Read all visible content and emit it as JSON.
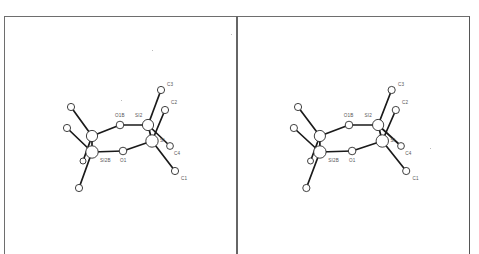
{
  "figure": {
    "type": "stereo ORTEP-style ball-and-stick view",
    "panels": [
      "left-eye",
      "right-eye"
    ]
  },
  "atoms": [
    {
      "id": "si_a",
      "label": "",
      "x": 92,
      "y": 136,
      "r": 5.6
    },
    {
      "id": "si1b",
      "label": "SI2B",
      "x": 92,
      "y": 152,
      "r": 6.2
    },
    {
      "id": "o1b",
      "label": "O1B",
      "x": 120,
      "y": 125,
      "r": 3.8
    },
    {
      "id": "si2",
      "label": "SI2",
      "x": 148,
      "y": 125,
      "r": 5.6
    },
    {
      "id": "si1",
      "label": "SI",
      "x": 152,
      "y": 141,
      "r": 6.2
    },
    {
      "id": "o1",
      "label": "O1",
      "x": 123,
      "y": 151,
      "r": 3.8
    },
    {
      "id": "c3",
      "label": "C3",
      "x": 161,
      "y": 90,
      "r": 3.6
    },
    {
      "id": "c2",
      "label": "C2",
      "x": 165,
      "y": 110,
      "r": 3.6
    },
    {
      "id": "c4",
      "label": "C4",
      "x": 170,
      "y": 146,
      "r": 3.4
    },
    {
      "id": "c1",
      "label": "C1",
      "x": 175,
      "y": 171,
      "r": 3.6
    },
    {
      "id": "ca",
      "label": "",
      "x": 71,
      "y": 107,
      "r": 3.6
    },
    {
      "id": "cb",
      "label": "",
      "x": 67,
      "y": 128,
      "r": 3.6
    },
    {
      "id": "cc",
      "label": "",
      "x": 83,
      "y": 161,
      "r": 3.0
    },
    {
      "id": "cd",
      "label": "",
      "x": 79,
      "y": 188,
      "r": 3.6
    }
  ],
  "bonds": [
    [
      "si_a",
      "o1b"
    ],
    [
      "o1b",
      "si2"
    ],
    [
      "si2",
      "si1"
    ],
    [
      "si1",
      "o1"
    ],
    [
      "o1",
      "si1b"
    ],
    [
      "si1b",
      "si_a"
    ],
    [
      "si2",
      "c3"
    ],
    [
      "si1",
      "c2"
    ],
    [
      "si2",
      "c4"
    ],
    [
      "si1",
      "c1"
    ],
    [
      "si_a",
      "ca"
    ],
    [
      "si1b",
      "cb"
    ],
    [
      "si_a",
      "cc"
    ],
    [
      "si1b",
      "cd"
    ]
  ],
  "labels": [
    {
      "text": "C3",
      "x": 167,
      "y": 86
    },
    {
      "text": "C2",
      "x": 171,
      "y": 104
    },
    {
      "text": "O1B",
      "x": 115,
      "y": 117
    },
    {
      "text": "SI2",
      "x": 135,
      "y": 117
    },
    {
      "text": "SI",
      "x": 160,
      "y": 142
    },
    {
      "text": "C4",
      "x": 174,
      "y": 155
    },
    {
      "text": "SI2B",
      "x": 100,
      "y": 162
    },
    {
      "text": "O1",
      "x": 120,
      "y": 162
    },
    {
      "text": "C1",
      "x": 181,
      "y": 180
    }
  ],
  "stereo_offset_px": 229
}
